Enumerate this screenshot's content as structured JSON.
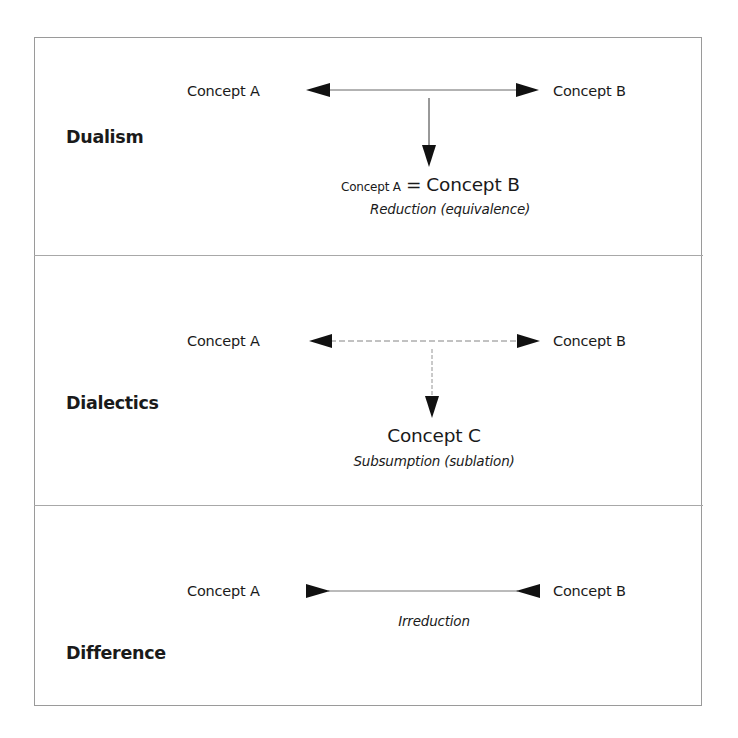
{
  "diagram": {
    "sections": [
      {
        "label": "Dualism",
        "left_concept": "Concept A",
        "right_concept": "Concept B",
        "arrow_style": "outward-double-arrow-with-down-arrow",
        "result": {
          "small_part": "Concept A",
          "operator": "=",
          "large_part": "Concept B"
        },
        "caption": "Reduction (equivalence)"
      },
      {
        "label": "Dialectics",
        "left_concept": "Concept A",
        "right_concept": "Concept B",
        "arrow_style": "outward-double-arrow-with-down-arrow",
        "result": {
          "large_part": "Concept C"
        },
        "caption": "Subsumption (sublation)"
      },
      {
        "label": "Difference",
        "left_concept": "Concept A",
        "right_concept": "Concept B",
        "arrow_style": "inward-pointing-arrowheads",
        "caption": "Irreduction"
      }
    ],
    "colors": {
      "border": "#9a9a9a",
      "arrow": "#111111",
      "line": "#555555",
      "text": "#1a1a1a"
    }
  }
}
